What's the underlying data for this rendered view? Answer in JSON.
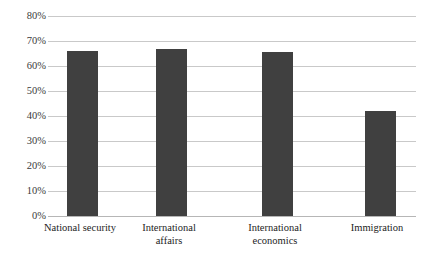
{
  "chart_data": {
    "type": "bar",
    "title": "",
    "subtitle": "",
    "xlabel": "",
    "ylabel": "",
    "categories": [
      "National security",
      "International affairs",
      "International economics",
      "Immigration"
    ],
    "values": [
      66,
      67,
      65.5,
      42
    ],
    "value_labels": [
      "66%",
      "67%",
      "65.5%",
      "42%"
    ],
    "ylim": [
      0,
      80
    ],
    "ytick_values": [
      0,
      10,
      20,
      30,
      40,
      50,
      60,
      70,
      80
    ],
    "ytick_labels": [
      "0%",
      "10%",
      "20%",
      "30%",
      "40%",
      "50%",
      "60%",
      "70%",
      "80%"
    ],
    "grid": true,
    "legend": false,
    "legend_position": "none",
    "bar_color": "#404040",
    "gridline_color": "#c9c9c9",
    "axis_color": "#b6b6b6",
    "background_color": "#ffffff"
  }
}
